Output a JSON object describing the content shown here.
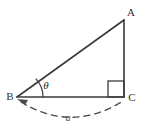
{
  "figure": {
    "type": "geometry-diagram",
    "background_color": "#ffffff",
    "stroke_color": "#3a3a3a",
    "dash_color": "#4a4a4a",
    "labels": {
      "vertex_a": "A",
      "vertex_b": "B",
      "vertex_c": "C",
      "angle_theta": "θ",
      "arc_length": "a"
    },
    "vertices": {
      "a": {
        "x": 124,
        "y": 20
      },
      "b": {
        "x": 17,
        "y": 97
      },
      "c": {
        "x": 124,
        "y": 97
      }
    },
    "label_positions": {
      "a": {
        "x": 131,
        "y": 16
      },
      "b": {
        "x": 10,
        "y": 100
      },
      "c": {
        "x": 131,
        "y": 101
      },
      "theta": {
        "x": 45,
        "y": 89
      },
      "arc": {
        "x": 67,
        "y": 121
      }
    },
    "right_angle_marker": {
      "x": 108,
      "y": 81,
      "size": 16
    },
    "theta_arc": {
      "radius": 26,
      "center_x": 17,
      "center_y": 97
    },
    "dashed_arc": {
      "start_x": 20,
      "start_y": 102,
      "end_x": 124,
      "end_y": 101,
      "control_x": 72,
      "control_y": 133,
      "dash_pattern": "6 5"
    }
  }
}
